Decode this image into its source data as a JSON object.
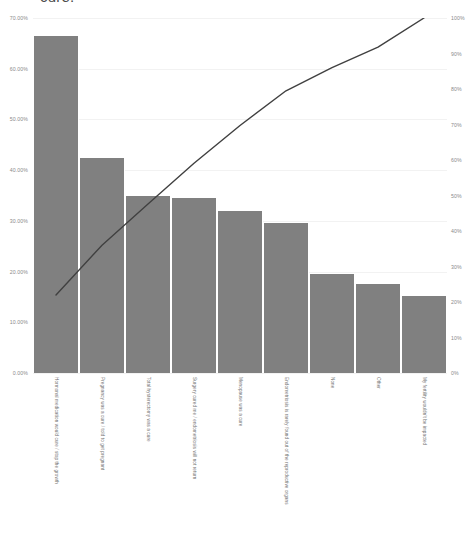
{
  "chart_data": {
    "type": "bar",
    "title": "cure.",
    "xlabel": "",
    "ylabel": "",
    "grid": true,
    "legend_position": "none",
    "categories": [
      "Hormonal medication would cure / stop the growth",
      "Pregnancy was a cure / told to get pregnant",
      "Total hysterectomy was a cure",
      "Surgery cured me / endometriosis will not return",
      "Menopause was a cure",
      "Endometriosis is rarely found out of the reproductive organs",
      "None",
      "Other",
      "My fertility wouldn't be impacted"
    ],
    "series": [
      {
        "name": "Responses",
        "type": "bar",
        "axis": "left",
        "values": [
          66.5,
          42.3,
          35.0,
          34.6,
          32.0,
          29.6,
          19.5,
          17.5,
          15.2
        ]
      },
      {
        "name": "Cumulative %",
        "type": "line",
        "axis": "right",
        "values": [
          22.0,
          36.0,
          47.6,
          59.1,
          69.7,
          79.5,
          86.0,
          91.8,
          100.0
        ]
      }
    ],
    "left_axis": {
      "ylim": [
        0,
        70
      ],
      "ticks": [
        0,
        10,
        20,
        30,
        40,
        50,
        60,
        70
      ],
      "tick_labels": [
        "0.00%",
        "10.00%",
        "20.00%",
        "30.00%",
        "40.00%",
        "50.00%",
        "60.00%",
        "70.00%"
      ]
    },
    "right_axis": {
      "ylim": [
        0,
        100
      ],
      "ticks": [
        0,
        10,
        20,
        30,
        40,
        50,
        60,
        70,
        80,
        90,
        100
      ],
      "tick_labels": [
        "0%",
        "10%",
        "20%",
        "30%",
        "40%",
        "50%",
        "60%",
        "70%",
        "80%",
        "90%",
        "100%"
      ]
    },
    "colors": {
      "bar": "#808080",
      "line": "#404040",
      "grid": "#f2f2f2",
      "tick_text": "#8a8a8a",
      "label_text": "#6f6f6f",
      "background": "#ffffff"
    }
  }
}
